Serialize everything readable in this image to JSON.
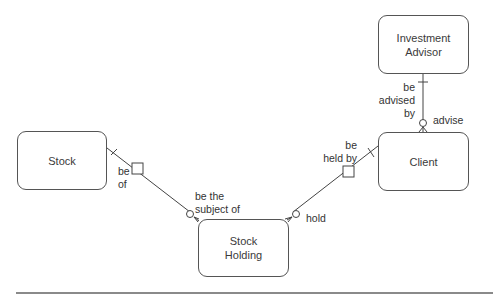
{
  "diagram": {
    "type": "entity-relationship",
    "entities": [
      {
        "id": "investment_advisor",
        "label": "Investment\nAdvisor"
      },
      {
        "id": "client",
        "label": "Client"
      },
      {
        "id": "stock",
        "label": "Stock"
      },
      {
        "id": "stock_holding",
        "label": "Stock\nHolding"
      }
    ],
    "relationships": [
      {
        "from": "investment_advisor",
        "to": "client",
        "label_from_side": "be\nadvised by",
        "label_to_side": "advise",
        "from_cardinality": "one (bar)",
        "to_cardinality": "zero-or-many (circle + crow's foot)"
      },
      {
        "from": "client",
        "to": "stock_holding",
        "label_from_side": "be\nheld by",
        "label_to_side": "hold",
        "from_cardinality": "one (bar)",
        "to_cardinality": "zero-or-many (circle + crow's foot)",
        "midpoint_marker": "square"
      },
      {
        "from": "stock",
        "to": "stock_holding",
        "label_from_side": "be\nof",
        "label_to_side": "be the\nsubject of",
        "from_cardinality": "one (bar)",
        "to_cardinality": "zero-or-many (circle + crow's foot)",
        "midpoint_marker": "square"
      }
    ],
    "line_color": "#444444",
    "rule_color": "#8a8a8a"
  }
}
